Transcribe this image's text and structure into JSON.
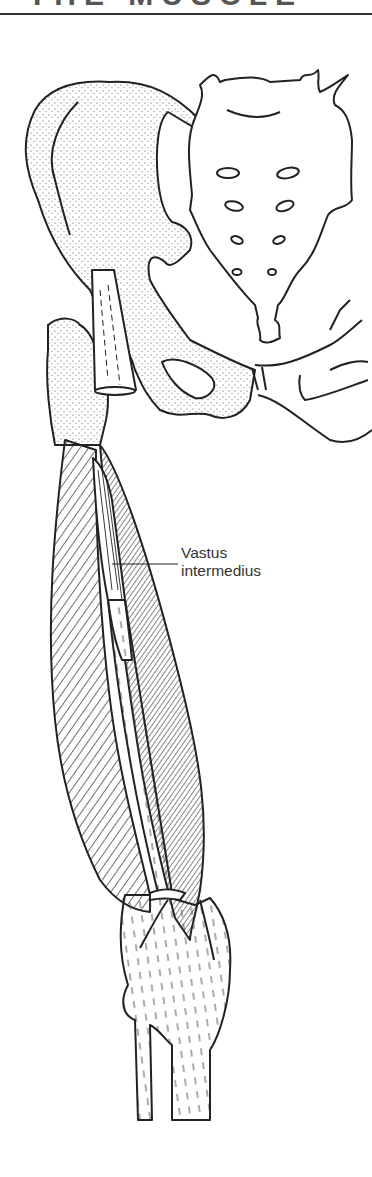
{
  "header": {
    "title_partial": "THE MUSCLE"
  },
  "figure": {
    "labels": [
      {
        "line1": "Vastus",
        "line2": "intermedius"
      }
    ]
  },
  "colors": {
    "ink": "#222222",
    "background": "#ffffff",
    "label_text": "#333333"
  }
}
